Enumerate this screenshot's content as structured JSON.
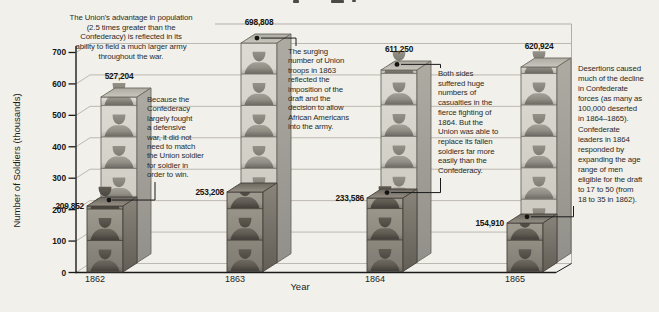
{
  "figure_type": "textbook-3d-pictorial-bar-chart",
  "colors": {
    "background": "#f2f0ea",
    "union_bar_front": "#d6d4cb",
    "confederate_bar_front": "#948f84",
    "axis": "#1a1a1a",
    "gridline": "#bcb9b0",
    "annotation_text": "#2b2b28"
  },
  "chart_data": {
    "type": "bar",
    "style": "3d pictorial bars built of stacked soldier silhouettes (each block = 100,000 soldiers)",
    "title": "",
    "xlabel": "Year",
    "ylabel": "Number of Soldiers (thousands)",
    "ylim": [
      0,
      700
    ],
    "ytick_step": 100,
    "yticks": [
      "0",
      "100",
      "200",
      "300",
      "400",
      "500",
      "600",
      "700"
    ],
    "grid": true,
    "legend": "none (series distinguished by bar color; identified in annotations)",
    "categories": [
      "1862",
      "1863",
      "1864",
      "1865"
    ],
    "series": [
      {
        "name": "Union",
        "row": "back",
        "shade": "light",
        "values": [
          527204,
          698808,
          611250,
          620924
        ],
        "value_labels": [
          "527,204",
          "698,808",
          "611,250",
          "620,924"
        ]
      },
      {
        "name": "Confederate",
        "row": "front",
        "shade": "dark",
        "values": [
          209852,
          253208,
          233586,
          154910
        ],
        "value_labels": [
          "209,852",
          "253,208",
          "233,586",
          "154,910"
        ]
      }
    ],
    "annotations": [
      {
        "id": "union-population-advantage",
        "target": "whole chart",
        "text": "The Union's advantage in population\n(2.5 times greater than the\nConfederacy) is reflected in its\nability to field a much larger army\nthroughout the war."
      },
      {
        "id": "confederate-defensive-war",
        "target": "Confederate bar 1862",
        "text": "Because the\nConfederacy\nlargely fought\na defensive\nwar, it did not\nneed to match\nthe Union soldier\nfor soldier in\norder to win."
      },
      {
        "id": "union-draft-1863",
        "target": "Union bar 1863",
        "text": "The surging\nnumber of Union\ntroops in 1863\nreflected the\nimposition of the\ndraft and the\ndecision to allow\nAfrican Americans\ninto the army."
      },
      {
        "id": "casualties-1864",
        "target": "Union bar 1864 and Confederate bar 1864",
        "text": "Both sides\nsuffered huge\nnumbers of\ncasualties in the\nfierce fighting of\n1864. But the\nUnion was able to\nreplace its fallen\nsoldiers far more\neasily than the\nConfederacy."
      },
      {
        "id": "confederate-desertions",
        "target": "Confederate bar 1865",
        "text": "Desertions caused\nmuch of the decline\nin Confederate\nforces (as many as\n100,000 deserted\nin 1864–1865).\nConfederate\nleaders in 1864\nresponded by\nexpanding the age\nrange of men\neligible for the draft\nto 17 to 50 (from\n18 to 35 in 1862)."
      }
    ]
  }
}
